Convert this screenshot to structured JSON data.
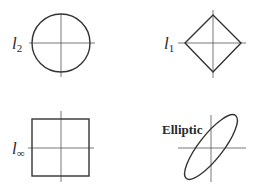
{
  "panels": [
    {
      "id": "l2",
      "label_base": "l",
      "label_sub": "2",
      "shape": "circle"
    },
    {
      "id": "l1",
      "label_base": "l",
      "label_sub": "1",
      "shape": "diamond"
    },
    {
      "id": "linf",
      "label_base": "l",
      "label_sub": "∞",
      "shape": "square"
    },
    {
      "id": "elliptic",
      "label": "Elliptic",
      "shape": "tilted-ellipse"
    }
  ],
  "colors": {
    "stroke": "#333333",
    "axis": "#555555",
    "background": "#ffffff"
  }
}
